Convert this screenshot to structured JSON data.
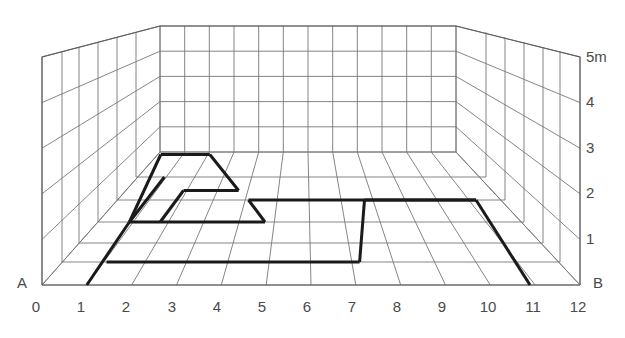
{
  "diagram": {
    "type": "perspective-room-grid",
    "title": "",
    "colors": {
      "background": "#ffffff",
      "grid_line": "#6e6e6e",
      "grid_line_faint": "#8d8d8d",
      "path_line": "#1a1a1a",
      "label_text": "#4a4a4a"
    },
    "line_widths": {
      "grid": 0.9,
      "room_edge": 1.1,
      "path": 3.0
    }
  },
  "floor_axis": {
    "label_A": "A",
    "label_B": "B",
    "ticks": [
      "0",
      "1",
      "2",
      "3",
      "4",
      "5",
      "6",
      "7",
      "8",
      "9",
      "10",
      "11",
      "12"
    ],
    "unit_count": 12
  },
  "height_axis": {
    "labels": [
      "5m",
      "4",
      "3",
      "2",
      "1",
      "B"
    ],
    "values": [
      5,
      4,
      3,
      2,
      1,
      0
    ],
    "unit": "m",
    "top_label": "5m"
  },
  "geometry": {
    "front_left": {
      "x": 42,
      "y": 285
    },
    "front_right": {
      "x": 580,
      "y": 285
    },
    "back_left": {
      "x": 160,
      "y": 152
    },
    "back_right": {
      "x": 456,
      "y": 152
    },
    "wall_top_front_left": {
      "x": 42,
      "y": 57
    },
    "wall_top_front_right": {
      "x": 580,
      "y": 57
    },
    "wall_top_back_left": {
      "x": 160,
      "y": 26
    },
    "wall_top_back_right": {
      "x": 456,
      "y": 26
    },
    "floor_depth_rows": 6,
    "wall_height_rows": 5,
    "floor_columns": 12
  },
  "path": {
    "name": "floor-plan-outline",
    "note": "Heavy polyline traced on floor grid in (column, depth-row) grid units; column 0..12 across, depth 0 at front edge to 6 at back wall.",
    "segments": [
      {
        "from": [
          1,
          0
        ],
        "to": [
          1,
          3
        ]
      },
      {
        "from": [
          1,
          3
        ],
        "to": [
          4.5,
          3
        ]
      },
      {
        "from": [
          4.5,
          3
        ],
        "to": [
          4.5,
          2
        ]
      },
      {
        "from": [
          4.5,
          2
        ],
        "to": [
          10,
          2
        ]
      },
      {
        "from": [
          10,
          2
        ],
        "to": [
          11,
          0
        ]
      },
      {
        "from": [
          1,
          3
        ],
        "to": [
          2.6,
          5
        ]
      },
      {
        "from": [
          2.6,
          5
        ],
        "to": [
          3.7,
          5
        ]
      },
      {
        "from": [
          3.7,
          5
        ],
        "to": [
          3.7,
          3.6
        ]
      },
      {
        "from": [
          3.7,
          3.6
        ],
        "to": [
          2.4,
          3.6
        ]
      },
      {
        "from": [
          7.3,
          2
        ],
        "to": [
          7.3,
          1
        ]
      },
      {
        "from": [
          7.3,
          1
        ],
        "to": [
          1,
          1
        ]
      }
    ]
  }
}
